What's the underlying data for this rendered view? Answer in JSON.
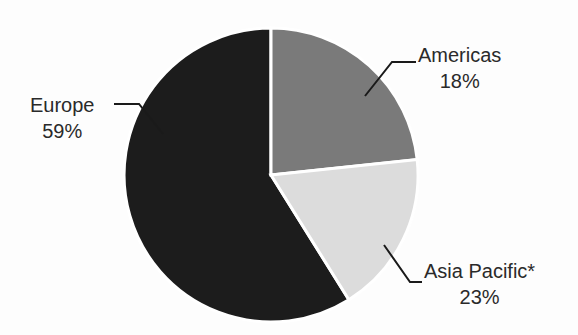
{
  "chart_data": {
    "type": "pie",
    "title": "",
    "subtitle": "",
    "xlabel": "",
    "ylabel": "",
    "legend_position": "callout-labels",
    "grid": false,
    "total_percent": 100,
    "categories": [
      "Americas",
      "Asia Pacific*",
      "Europe"
    ],
    "values": [
      18,
      23,
      59
    ],
    "value_suffix": "%",
    "slices": [
      {
        "name": "Americas",
        "value": 18,
        "value_label": "18%",
        "color": "#7a7a7a",
        "start_angle_deg": 0,
        "end_angle_deg": 84,
        "label_side": "right"
      },
      {
        "name": "Asia Pacific*",
        "value": 23,
        "value_label": "23%",
        "color": "#dcdcdc",
        "start_angle_deg": 84,
        "end_angle_deg": 148,
        "label_side": "right"
      },
      {
        "name": "Europe",
        "value": 59,
        "value_label": "59%",
        "color": "#1c1c1c",
        "start_angle_deg": 148,
        "end_angle_deg": 360,
        "label_side": "left"
      }
    ],
    "annotations": [
      "*"
    ],
    "colors": {
      "americas": "#7a7a7a",
      "asia_pacific": "#dcdcdc",
      "europe": "#1c1c1c",
      "background": "#fdfdfd",
      "leader_line": "#1a1a1a",
      "slice_border": "#ffffff",
      "text": "#2a2a2a"
    }
  },
  "labels": {
    "americas": {
      "name": "Americas",
      "value": "18%"
    },
    "asia_pacific": {
      "name": "Asia Pacific*",
      "value": "23%"
    },
    "europe": {
      "name": "Europe",
      "value": "59%"
    }
  }
}
